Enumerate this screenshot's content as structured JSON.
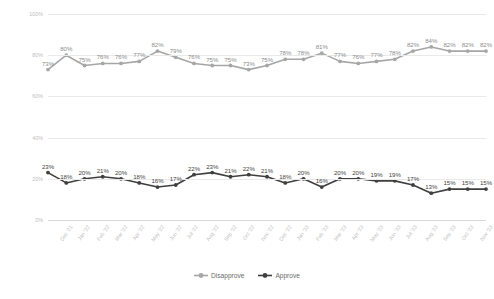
{
  "chart_data": {
    "type": "line",
    "title": "",
    "xlabel": "",
    "ylabel": "Share of respondents",
    "ylim": [
      0,
      100
    ],
    "ytick_labels": [
      "100%",
      "80%",
      "60%",
      "40%",
      "20%",
      "0%"
    ],
    "ytick_values": [
      100,
      80,
      60,
      40,
      20,
      0
    ],
    "grid": true,
    "legend_position": "bottom",
    "categories": [
      "Dec '21",
      "Jan '22",
      "Feb '22",
      "Mar '22",
      "Apr '22",
      "May '22",
      "Jun '22",
      "Jul '22",
      "Aug '22",
      "Sep '22",
      "Oct '22",
      "Nov '22",
      "Dec '22",
      "Jan '23",
      "Feb '23",
      "Mar '23",
      "Apr '23",
      "May '23",
      "Jun '23",
      "Jul '23",
      "Aug '23",
      "Sep '23",
      "Oct '23",
      "Nov '23",
      "Dec '23"
    ],
    "series": [
      {
        "name": "Disapprove",
        "color": "#a6a6a6",
        "values": [
          73,
          80,
          75,
          76,
          76,
          77,
          82,
          79,
          76,
          75,
          75,
          73,
          75,
          78,
          78,
          81,
          77,
          76,
          77,
          78,
          82,
          84,
          82,
          82,
          82
        ],
        "labels": [
          "73%",
          "80%",
          "75%",
          "76%",
          "76%",
          "77%",
          "82%",
          "79%",
          "76%",
          "75%",
          "75%",
          "73%",
          "75%",
          "78%",
          "78%",
          "81%",
          "77%",
          "76%",
          "77%",
          "78%",
          "82%",
          "84%",
          "82%",
          "82%",
          "82%"
        ]
      },
      {
        "name": "Approve",
        "color": "#3f3f3f",
        "values": [
          23,
          18,
          20,
          21,
          20,
          18,
          16,
          17,
          22,
          23,
          21,
          22,
          21,
          18,
          20,
          16,
          20,
          20,
          19,
          19,
          17,
          13,
          15,
          15,
          15
        ],
        "labels": [
          "23%",
          "18%",
          "20%",
          "21%",
          "20%",
          "18%",
          "16%",
          "17%",
          "22%",
          "23%",
          "21%",
          "22%",
          "21%",
          "18%",
          "20%",
          "16%",
          "20%",
          "20%",
          "19%",
          "19%",
          "17%",
          "13%",
          "15%",
          "15%",
          "15%"
        ]
      }
    ]
  },
  "legend": {
    "items": [
      {
        "label": "Disapprove",
        "color": "#a6a6a6"
      },
      {
        "label": "Approve",
        "color": "#3f3f3f"
      }
    ]
  }
}
